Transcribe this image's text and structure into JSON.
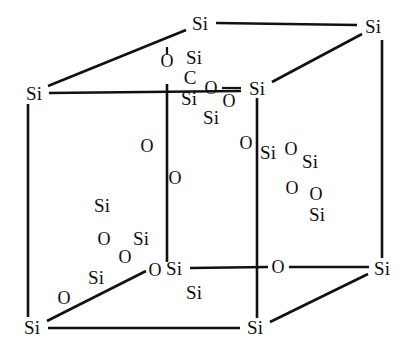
{
  "figure": {
    "kind": "molecular-structure-diagram",
    "background_color": "#ffffff",
    "line_color": "#111111",
    "text_color": "#0d0d0d",
    "width": 406,
    "height": 349
  },
  "atom_labels": {
    "si": "Si",
    "o": "O",
    "c": "C"
  },
  "cube_vertices": [
    {
      "name": "vertex-top-back-left",
      "label": "Si",
      "x": 200,
      "y": 23,
      "size": 19
    },
    {
      "name": "vertex-top-back-right",
      "label": "Si",
      "x": 373,
      "y": 26,
      "size": 19
    },
    {
      "name": "vertex-top-front-left",
      "label": "Si",
      "x": 34,
      "y": 93,
      "size": 19
    },
    {
      "name": "vertex-top-front-right",
      "label": "Si",
      "x": 257,
      "y": 88,
      "size": 19
    },
    {
      "name": "vertex-bottom-front-left",
      "label": "Si",
      "x": 32,
      "y": 327,
      "size": 19
    },
    {
      "name": "vertex-bottom-front-right",
      "label": "Si",
      "x": 255,
      "y": 327,
      "size": 19
    },
    {
      "name": "vertex-bottom-back-left",
      "label": "Si",
      "x": 174,
      "y": 268,
      "size": 19
    },
    {
      "name": "vertex-bottom-back-right",
      "label": "Si",
      "x": 382,
      "y": 268,
      "size": 19
    }
  ],
  "edge_atoms": [
    {
      "name": "edge-atom-top-center-o",
      "label": "O",
      "x": 167,
      "y": 61,
      "size": 18
    },
    {
      "name": "edge-atom-bottom-right-o",
      "label": "O",
      "x": 278,
      "y": 267,
      "size": 18
    },
    {
      "name": "edge-atom-bottom-left-o",
      "label": "O",
      "x": 155,
      "y": 270,
      "size": 18
    }
  ],
  "center_cluster": [
    {
      "name": "cluster-center-si-1",
      "label": "Si",
      "x": 194,
      "y": 57,
      "size": 19
    },
    {
      "name": "cluster-center-c",
      "label": "C",
      "x": 190,
      "y": 77,
      "size": 19
    },
    {
      "name": "cluster-center-si-2",
      "label": "Si",
      "x": 189,
      "y": 98,
      "size": 19
    },
    {
      "name": "cluster-center-o-1",
      "label": "O",
      "x": 211,
      "y": 88,
      "size": 18
    },
    {
      "name": "cluster-center-o-2",
      "label": "O",
      "x": 229,
      "y": 101,
      "size": 18
    },
    {
      "name": "cluster-center-si-3",
      "label": "Si",
      "x": 211,
      "y": 117,
      "size": 19
    }
  ],
  "right_cluster": [
    {
      "name": "right-cluster-o-1",
      "label": "O",
      "x": 246,
      "y": 143,
      "size": 18
    },
    {
      "name": "right-cluster-si-1",
      "label": "Si",
      "x": 268,
      "y": 152,
      "size": 19
    },
    {
      "name": "right-cluster-o-2",
      "label": "O",
      "x": 291,
      "y": 149,
      "size": 18
    },
    {
      "name": "right-cluster-si-2",
      "label": "Si",
      "x": 310,
      "y": 161,
      "size": 19
    },
    {
      "name": "right-cluster-o-3",
      "label": "O",
      "x": 292,
      "y": 188,
      "size": 18
    },
    {
      "name": "right-cluster-o-4",
      "label": "O",
      "x": 316,
      "y": 194,
      "size": 18
    },
    {
      "name": "right-cluster-si-3",
      "label": "Si",
      "x": 317,
      "y": 214,
      "size": 19
    }
  ],
  "mid_left_oxygens": [
    {
      "name": "mid-left-o-1",
      "label": "O",
      "x": 147,
      "y": 146,
      "size": 18
    },
    {
      "name": "mid-left-o-2",
      "label": "O",
      "x": 175,
      "y": 178,
      "size": 18
    }
  ],
  "lower_left_cluster": [
    {
      "name": "lower-left-si-1",
      "label": "Si",
      "x": 102,
      "y": 205,
      "size": 19
    },
    {
      "name": "lower-left-o-1",
      "label": "O",
      "x": 104,
      "y": 239,
      "size": 18
    },
    {
      "name": "lower-left-si-2",
      "label": "Si",
      "x": 141,
      "y": 238,
      "size": 19
    },
    {
      "name": "lower-left-o-2",
      "label": "O",
      "x": 125,
      "y": 257,
      "size": 18
    },
    {
      "name": "lower-left-si-3",
      "label": "Si",
      "x": 96,
      "y": 277,
      "size": 19
    },
    {
      "name": "lower-left-o-3",
      "label": "O",
      "x": 64,
      "y": 298,
      "size": 18
    }
  ],
  "lower_center_label": {
    "name": "lower-center-si",
    "label": "Si",
    "x": 194,
    "y": 292,
    "size": 19
  },
  "edges": [
    {
      "name": "edge-top-back",
      "x1": 216,
      "y1": 23,
      "x2": 357,
      "y2": 25,
      "width": 2.6
    },
    {
      "name": "edge-top-left-diagonal",
      "x1": 48,
      "y1": 86,
      "x2": 186,
      "y2": 30,
      "width": 2.6
    },
    {
      "name": "edge-top-right-diagonal",
      "x1": 272,
      "y1": 82,
      "x2": 362,
      "y2": 34,
      "width": 2.6
    },
    {
      "name": "edge-top-front",
      "x1": 49,
      "y1": 93,
      "x2": 241,
      "y2": 91,
      "width": 2.6
    },
    {
      "name": "edge-left-vertical",
      "x1": 28,
      "y1": 104,
      "x2": 28,
      "y2": 317,
      "width": 2.6
    },
    {
      "name": "edge-right-vertical",
      "x1": 382,
      "y1": 40,
      "x2": 382,
      "y2": 258,
      "width": 2.6
    },
    {
      "name": "edge-inner-left-vertical",
      "x1": 167,
      "y1": 84,
      "x2": 167,
      "y2": 262,
      "width": 2.6
    },
    {
      "name": "edge-inner-right-vertical",
      "x1": 257,
      "y1": 98,
      "x2": 257,
      "y2": 318,
      "width": 2.6
    },
    {
      "name": "edge-bottom-front",
      "x1": 48,
      "y1": 328,
      "x2": 240,
      "y2": 328,
      "width": 2.6
    },
    {
      "name": "edge-bottom-back",
      "x1": 190,
      "y1": 268,
      "x2": 268,
      "y2": 267,
      "width": 2.6
    },
    {
      "name": "edge-bottom-back-right",
      "x1": 289,
      "y1": 267,
      "x2": 369,
      "y2": 267,
      "width": 2.6
    },
    {
      "name": "edge-bottom-left-diagonal",
      "x1": 47,
      "y1": 321,
      "x2": 146,
      "y2": 271,
      "width": 2.6
    },
    {
      "name": "edge-bottom-right-diagonal",
      "x1": 270,
      "y1": 322,
      "x2": 368,
      "y2": 274,
      "width": 2.6
    },
    {
      "name": "bond-center-o-stub",
      "x1": 167,
      "y1": 47,
      "x2": 167,
      "y2": 54,
      "width": 2.2
    },
    {
      "name": "bond-center-o-to-si",
      "x1": 222,
      "y1": 88,
      "x2": 241,
      "y2": 88,
      "width": 2.2
    }
  ]
}
